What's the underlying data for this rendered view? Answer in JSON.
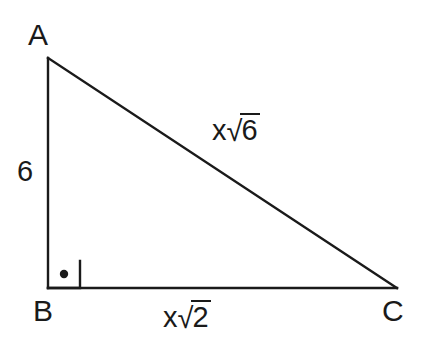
{
  "figure": {
    "type": "right-triangle-diagram",
    "background_color": "#ffffff",
    "stroke_color": "#1a1a1a",
    "vertices": {
      "a": {
        "label": "A",
        "x": 48,
        "y": 58
      },
      "b": {
        "label": "B",
        "x": 48,
        "y": 288
      },
      "c": {
        "label": "C",
        "x": 397,
        "y": 288
      }
    },
    "sides": {
      "leg_ab": {
        "label": "6",
        "from": "A",
        "to": "B"
      },
      "base_bc": {
        "label": "x√2",
        "coefficient": "x",
        "radical_sign": "√",
        "radicand": "2",
        "from": "B",
        "to": "C"
      },
      "hypotenuse_ac": {
        "label": "x√6",
        "coefficient": "x",
        "radical_sign": "√",
        "radicand": "6",
        "from": "A",
        "to": "C"
      }
    },
    "right_angle": {
      "at_vertex": "B",
      "marker": "square-with-center-dot",
      "size": 32
    }
  }
}
